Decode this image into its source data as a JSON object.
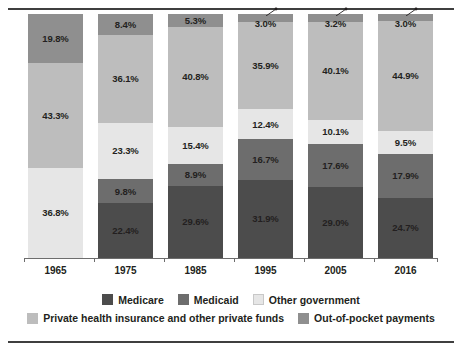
{
  "chart_data": {
    "type": "bar",
    "subtype": "stacked-100-percent",
    "title": "",
    "xlabel": "",
    "ylabel": "",
    "ylim": [
      0,
      100
    ],
    "grid": false,
    "legend_position": "bottom",
    "value_suffix": "%",
    "categories": [
      "1965",
      "1975",
      "1985",
      "1995",
      "2005",
      "2016"
    ],
    "series": [
      {
        "name": "Medicare",
        "color": "#4c4c4c",
        "values": [
          null,
          22.4,
          29.6,
          31.9,
          29.0,
          24.7
        ],
        "labels": [
          "",
          "22.4%",
          "29.6%",
          "31.9%",
          "29.0%",
          "24.7%"
        ]
      },
      {
        "name": "Medicaid",
        "color": "#6d6d6d",
        "values": [
          null,
          9.8,
          8.9,
          16.7,
          17.6,
          17.9
        ],
        "labels": [
          "",
          "9.8%",
          "8.9%",
          "16.7%",
          "17.6%",
          "17.9%"
        ]
      },
      {
        "name": "Other government",
        "color": "#e6e6e6",
        "values": [
          36.8,
          23.3,
          15.4,
          12.4,
          10.1,
          9.5
        ],
        "labels": [
          "36.8%",
          "23.3%",
          "15.4%",
          "12.4%",
          "10.1%",
          "9.5%"
        ]
      },
      {
        "name": "Private health insurance and other private funds",
        "color": "#bdbdbd",
        "values": [
          43.3,
          36.1,
          40.8,
          35.9,
          40.1,
          44.9
        ],
        "labels": [
          "43.3%",
          "36.1%",
          "40.8%",
          "35.9%",
          "40.1%",
          "44.9%"
        ]
      },
      {
        "name": "Out-of-pocket payments",
        "color": "#8f8f8f",
        "values": [
          19.8,
          8.4,
          5.3,
          3.0,
          3.2,
          3.0
        ],
        "labels": [
          "19.8%",
          "8.4%",
          "5.3%",
          "3.0%",
          "3.2%",
          "3.0%"
        ],
        "callout": [
          false,
          false,
          false,
          true,
          true,
          true
        ]
      }
    ]
  },
  "legend": {
    "row1": [
      {
        "label": "Medicare",
        "color": "#4c4c4c"
      },
      {
        "label": "Medicaid",
        "color": "#6d6d6d"
      },
      {
        "label": "Other government",
        "color": "#e6e6e6"
      }
    ],
    "row2": [
      {
        "label": "Private health insurance and other private funds",
        "color": "#bdbdbd"
      },
      {
        "label": "Out-of-pocket payments",
        "color": "#8f8f8f"
      }
    ]
  },
  "axis": {
    "tick_labels": [
      "1965",
      "1975",
      "1985",
      "1995",
      "2005",
      "2016"
    ]
  }
}
